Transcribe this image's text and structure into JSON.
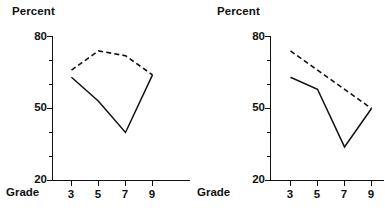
{
  "figure": {
    "background_color": "#ffffff",
    "ink_color": "#111111",
    "panel_count": 2
  },
  "chart_data": [
    {
      "type": "line",
      "panel_id": "left",
      "title": "",
      "ylabel": "Percent",
      "xlabel": "Grade",
      "categories": [
        "3",
        "5",
        "7",
        "9"
      ],
      "x": [
        3,
        5,
        7,
        9
      ],
      "ylim": [
        20,
        80
      ],
      "y_major_ticks": [
        20,
        50,
        80
      ],
      "y_major_tick_labels": [
        "20",
        "50",
        "80"
      ],
      "y_minor_ticks": [
        30,
        40,
        60,
        70
      ],
      "x_tick_labels": [
        "3",
        "5",
        "7",
        "9"
      ],
      "grid": false,
      "legend": "none",
      "series": [
        {
          "name": "solid",
          "style": "solid",
          "values": [
            63,
            53,
            40,
            64
          ]
        },
        {
          "name": "dashed",
          "style": "dashed",
          "values": [
            66,
            74,
            72,
            64
          ]
        }
      ]
    },
    {
      "type": "line",
      "panel_id": "right",
      "title": "",
      "ylabel": "Percent",
      "xlabel": "Grade",
      "categories": [
        "3",
        "5",
        "7",
        "9"
      ],
      "x": [
        3,
        5,
        7,
        9
      ],
      "ylim": [
        20,
        80
      ],
      "y_major_ticks": [
        20,
        50,
        80
      ],
      "y_major_tick_labels": [
        "20",
        "50",
        "80"
      ],
      "y_minor_ticks": [
        30,
        40,
        60,
        70
      ],
      "x_tick_labels": [
        "3",
        "5",
        "7",
        "9"
      ],
      "grid": false,
      "legend": "none",
      "series": [
        {
          "name": "solid",
          "style": "solid",
          "values": [
            63,
            58,
            34,
            50
          ]
        },
        {
          "name": "dashed",
          "style": "dashed",
          "values": [
            74,
            null,
            null,
            50
          ]
        }
      ]
    }
  ],
  "left_panel": {
    "y_axis_title": "Percent",
    "x_axis_title": "Grade",
    "y_labels": [
      "80",
      "50",
      "20"
    ],
    "x_labels": [
      "3",
      "5",
      "7",
      "9"
    ]
  },
  "right_panel": {
    "y_axis_title": "Percent",
    "x_axis_title": "Grade",
    "y_labels": [
      "80",
      "50",
      "20"
    ],
    "x_labels": [
      "3",
      "5",
      "7",
      "9"
    ]
  }
}
